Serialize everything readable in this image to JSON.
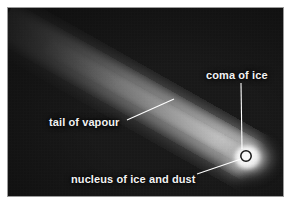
{
  "figure": {
    "panel_background_color": "#161616",
    "page_background_color": "#ffffff",
    "panel_border_color": "#9a9a9a",
    "label_color": "#f2f2f2",
    "leader_line_color": "#ffffff"
  },
  "labels": {
    "coma": "coma of ice",
    "tail": "tail of vapour",
    "nucleus": "nucleus of ice and dust"
  },
  "parts": {
    "coma_name": "coma-glow",
    "tail_name": "vapour-tail",
    "nucleus_name": "nucleus-core"
  }
}
